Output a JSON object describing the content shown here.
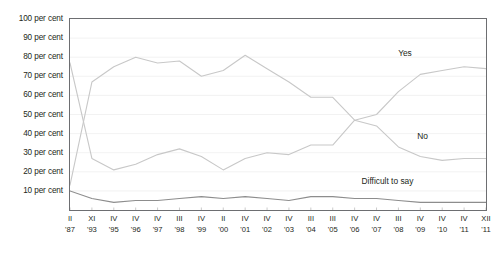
{
  "chart_data": {
    "type": "line",
    "title": "",
    "xlabel": "",
    "ylabel": "",
    "ylim": [
      0,
      100
    ],
    "grid": true,
    "legend_position": "inline-annotations",
    "ytick_labels": [
      "10 per cent",
      "20 per cent",
      "30 per cent",
      "40 per cent",
      "50 per cent",
      "60 per cent",
      "70 per cent",
      "80 per cent",
      "90 per cent",
      "100 per cent"
    ],
    "ytick_values": [
      10,
      20,
      30,
      40,
      50,
      60,
      70,
      80,
      90,
      100
    ],
    "categories": [
      {
        "month": "II",
        "year": "'87"
      },
      {
        "month": "XI",
        "year": "'93"
      },
      {
        "month": "IV",
        "year": "'95"
      },
      {
        "month": "IV",
        "year": "'96"
      },
      {
        "month": "IV",
        "year": "'97"
      },
      {
        "month": "III",
        "year": "'98"
      },
      {
        "month": "IV",
        "year": "'99"
      },
      {
        "month": "II",
        "year": "'00"
      },
      {
        "month": "IV",
        "year": "'01"
      },
      {
        "month": "IV",
        "year": "'02"
      },
      {
        "month": "IV",
        "year": "'03"
      },
      {
        "month": "III",
        "year": "'04"
      },
      {
        "month": "III",
        "year": "'05"
      },
      {
        "month": "IV",
        "year": "'06"
      },
      {
        "month": "IV",
        "year": "'07"
      },
      {
        "month": "III",
        "year": "'08"
      },
      {
        "month": "IV",
        "year": "'09"
      },
      {
        "month": "IV",
        "year": "'10"
      },
      {
        "month": "IV",
        "year": "'11"
      },
      {
        "month": "XII",
        "year": "'11"
      }
    ],
    "series": [
      {
        "name": "No",
        "color": "#c8c8c8",
        "label_x_index": 16.1,
        "label_y_value": 39,
        "values": [
          77,
          27,
          21,
          24,
          29,
          32,
          28,
          21,
          27,
          30,
          29,
          34,
          34,
          47,
          44,
          33,
          28,
          26,
          27,
          27
        ]
      },
      {
        "name": "Yes",
        "color": "#c8c8c8",
        "label_x_index": 15.3,
        "label_y_value": 82,
        "values": [
          13,
          67,
          75,
          80,
          77,
          78,
          70,
          73,
          81,
          74,
          67,
          59,
          59,
          47,
          50,
          62,
          71,
          73,
          75,
          74
        ]
      },
      {
        "name": "Difficult to say",
        "color": "#8d8d8d",
        "label_x_index": 14.5,
        "label_y_value": 15,
        "values": [
          10,
          6,
          4,
          5,
          5,
          6,
          7,
          6,
          7,
          6,
          5,
          7,
          7,
          6,
          6,
          5,
          4,
          4,
          4,
          4
        ]
      }
    ]
  }
}
